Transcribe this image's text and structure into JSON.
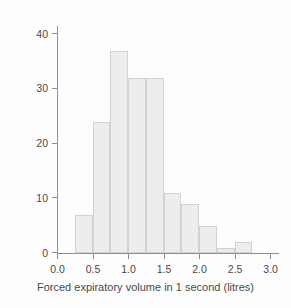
{
  "chart_data": {
    "type": "bar",
    "title": "",
    "subtitle": "",
    "xlabel": "Forced expiratory volume in 1 second (litres)",
    "ylabel": "Frequency",
    "xlim": [
      0.0,
      3.125
    ],
    "ylim": [
      0,
      41.5
    ],
    "grid": false,
    "legend": null,
    "bin_width": 0.25,
    "bin_edges": [
      0.25,
      0.5,
      0.75,
      1.0,
      1.25,
      1.5,
      1.75,
      2.0,
      2.25,
      2.5,
      2.75
    ],
    "categories": [
      "0.25-0.50",
      "0.50-0.75",
      "0.75-1.00",
      "1.00-1.25",
      "1.25-1.50",
      "1.50-1.75",
      "1.75-2.00",
      "2.00-2.25",
      "2.25-2.50",
      "2.50-2.75"
    ],
    "values": [
      7,
      24,
      37,
      32,
      32,
      11,
      9,
      5,
      1,
      2
    ],
    "xticks": [
      0.0,
      0.5,
      1.0,
      1.5,
      2.0,
      2.5,
      3.0
    ],
    "xticklabels": [
      "0.0",
      "0.5",
      "1.0",
      "1.5",
      "2.0",
      "2.5",
      "3.0"
    ],
    "yticks": [
      0,
      10,
      20,
      30,
      40
    ],
    "yticklabels": [
      "0",
      "10",
      "20",
      "30",
      "40"
    ],
    "bar_fill_color": "#ededed",
    "bar_edge_color": "#d2d2d2",
    "axis_color": "#8f8f8f",
    "text_color": "#4a4a4a",
    "background_color": "#fdfdfd"
  }
}
